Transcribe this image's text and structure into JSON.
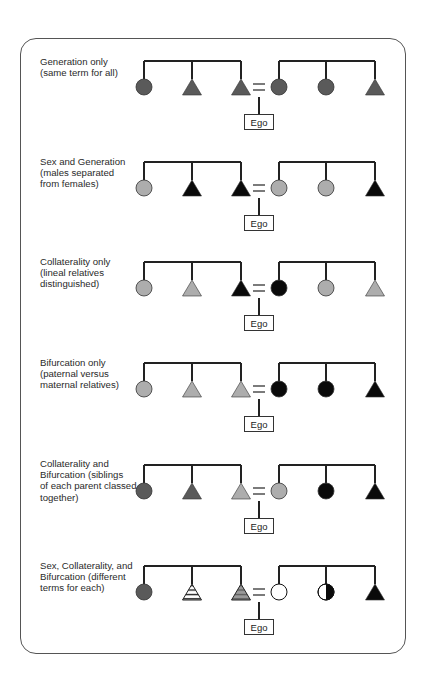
{
  "colors": {
    "dark_gray": "#5a5a5a",
    "light_gray": "#adadad",
    "black": "#0a0a0a",
    "white": "#ffffff",
    "line": "#222222"
  },
  "ego_label": "Ego",
  "rows": [
    {
      "label": [
        "Generation only",
        "(same term for all)"
      ],
      "left": [
        {
          "shape": "circle",
          "fill": "dark_gray"
        },
        {
          "shape": "triangle",
          "fill": "dark_gray"
        },
        {
          "shape": "triangle",
          "fill": "dark_gray"
        }
      ],
      "right": [
        {
          "shape": "circle",
          "fill": "dark_gray"
        },
        {
          "shape": "circle",
          "fill": "dark_gray"
        },
        {
          "shape": "triangle",
          "fill": "dark_gray"
        }
      ]
    },
    {
      "label": [
        "Sex and Generation",
        "(males separated",
        "from females)"
      ],
      "left": [
        {
          "shape": "circle",
          "fill": "light_gray"
        },
        {
          "shape": "triangle",
          "fill": "black"
        },
        {
          "shape": "triangle",
          "fill": "black"
        }
      ],
      "right": [
        {
          "shape": "circle",
          "fill": "light_gray"
        },
        {
          "shape": "circle",
          "fill": "light_gray"
        },
        {
          "shape": "triangle",
          "fill": "black"
        }
      ]
    },
    {
      "label": [
        "Collaterality only",
        "(lineal relatives",
        "distinguished)"
      ],
      "left": [
        {
          "shape": "circle",
          "fill": "light_gray"
        },
        {
          "shape": "triangle",
          "fill": "light_gray"
        },
        {
          "shape": "triangle",
          "fill": "black"
        }
      ],
      "right": [
        {
          "shape": "circle",
          "fill": "black"
        },
        {
          "shape": "circle",
          "fill": "light_gray"
        },
        {
          "shape": "triangle",
          "fill": "light_gray"
        }
      ]
    },
    {
      "label": [
        "Bifurcation only",
        "(paternal versus",
        "maternal relatives)"
      ],
      "left": [
        {
          "shape": "circle",
          "fill": "light_gray"
        },
        {
          "shape": "triangle",
          "fill": "light_gray"
        },
        {
          "shape": "triangle",
          "fill": "light_gray"
        }
      ],
      "right": [
        {
          "shape": "circle",
          "fill": "black"
        },
        {
          "shape": "circle",
          "fill": "black"
        },
        {
          "shape": "triangle",
          "fill": "black"
        }
      ]
    },
    {
      "label": [
        "Collaterality and",
        "Bifurcation (siblings",
        "of each parent classed",
        "together)"
      ],
      "left": [
        {
          "shape": "circle",
          "fill": "dark_gray"
        },
        {
          "shape": "triangle",
          "fill": "dark_gray"
        },
        {
          "shape": "triangle",
          "fill": "light_gray"
        }
      ],
      "right": [
        {
          "shape": "circle",
          "fill": "light_gray"
        },
        {
          "shape": "circle",
          "fill": "black"
        },
        {
          "shape": "triangle",
          "fill": "black"
        }
      ]
    },
    {
      "label": [
        "Sex, Collaterality, and",
        "Bifurcation (different",
        "terms for each)"
      ],
      "left": [
        {
          "shape": "circle",
          "fill": "dark_gray"
        },
        {
          "shape": "triangle",
          "fill": "white-striped"
        },
        {
          "shape": "triangle",
          "fill": "gray-striped"
        }
      ],
      "right": [
        {
          "shape": "circle",
          "fill": "white"
        },
        {
          "shape": "circle",
          "fill": "half-white-black"
        },
        {
          "shape": "triangle",
          "fill": "black"
        }
      ]
    }
  ]
}
